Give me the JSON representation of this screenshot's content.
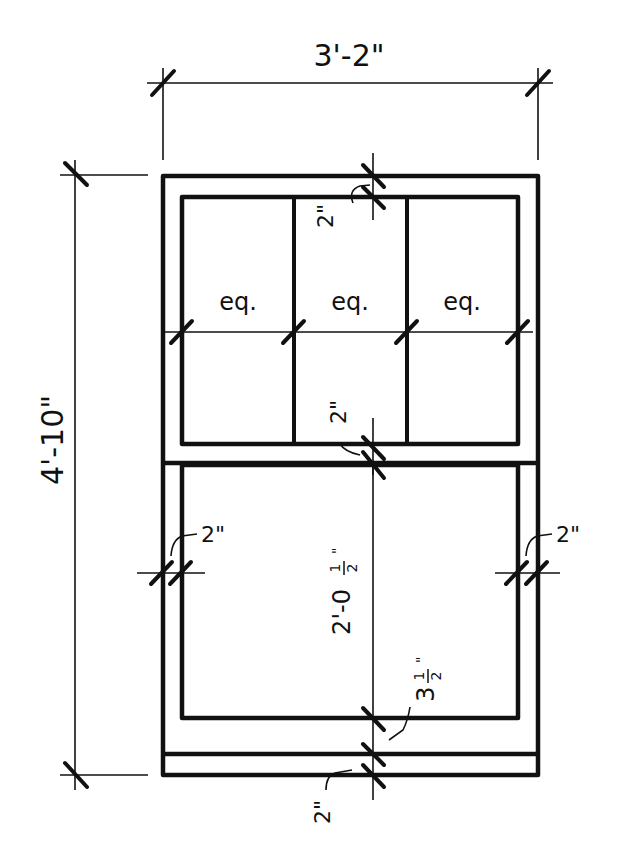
{
  "drawing": {
    "type": "window elevation",
    "overall_width_label": "3'-2\"",
    "overall_height_label": "4'-10\"",
    "upper_sash": {
      "panes_across": 3,
      "pane_labels": [
        "eq.",
        "eq.",
        "eq."
      ],
      "top_rail_label": "2\"",
      "meeting_rail_label": "2\""
    },
    "lower_sash": {
      "left_stile_label": "2\"",
      "right_stile_label": "2\"",
      "glass_height_label_main": "2'-0",
      "glass_height_label_frac_num": "1",
      "glass_height_label_frac_den": "2",
      "glass_height_label_inch": "\"",
      "bottom_rail_label_main": "3",
      "bottom_rail_label_frac_num": "1",
      "bottom_rail_label_frac_den": "2",
      "bottom_rail_label_inch": "\"",
      "sill_label": "2\""
    },
    "colors": {
      "line": "#111111",
      "background": "#ffffff"
    }
  }
}
